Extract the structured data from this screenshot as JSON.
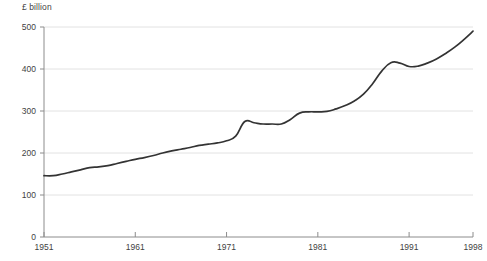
{
  "chart_data": {
    "type": "line",
    "title": "",
    "subtitle": "",
    "unit_label": "£ billion",
    "xlabel": "",
    "ylabel": "",
    "xlim": [
      1951,
      1998
    ],
    "ylim": [
      0,
      500
    ],
    "grid": true,
    "legend_position": "none",
    "line_color": "#333333",
    "gridline_color": "#e2e2e2",
    "axis_color": "#8c8c8c",
    "x_tick_labels": [
      "1951",
      "1961",
      "1971",
      "1981",
      "1991",
      "1998"
    ],
    "x_tick_values": [
      1951,
      1961,
      1971,
      1981,
      1991,
      1998
    ],
    "y_tick_labels": [
      "0",
      "100",
      "200",
      "300",
      "400",
      "500"
    ],
    "y_tick_values": [
      0,
      100,
      200,
      300,
      400,
      500
    ],
    "x": [
      1951,
      1952,
      1953,
      1954,
      1955,
      1956,
      1957,
      1958,
      1959,
      1960,
      1961,
      1962,
      1963,
      1964,
      1965,
      1966,
      1967,
      1968,
      1969,
      1970,
      1971,
      1972,
      1973,
      1974,
      1975,
      1976,
      1977,
      1978,
      1979,
      1980,
      1981,
      1982,
      1983,
      1984,
      1985,
      1986,
      1987,
      1988,
      1989,
      1990,
      1991,
      1992,
      1993,
      1994,
      1995,
      1996,
      1997,
      1998
    ],
    "values": [
      146,
      146,
      150,
      155,
      160,
      165,
      167,
      170,
      175,
      180,
      185,
      189,
      194,
      200,
      205,
      209,
      213,
      218,
      221,
      224,
      229,
      240,
      275,
      272,
      269,
      269,
      269,
      280,
      295,
      298,
      298,
      299,
      305,
      313,
      324,
      340,
      365,
      395,
      415,
      414,
      406,
      407,
      414,
      424,
      437,
      452,
      470,
      490
    ],
    "series": [
      {
        "name": "£ billion",
        "values": [
          146,
          146,
          150,
          155,
          160,
          165,
          167,
          170,
          175,
          180,
          185,
          189,
          194,
          200,
          205,
          209,
          213,
          218,
          221,
          224,
          229,
          240,
          275,
          272,
          269,
          269,
          269,
          280,
          295,
          298,
          298,
          299,
          305,
          313,
          324,
          340,
          365,
          395,
          415,
          414,
          406,
          407,
          414,
          424,
          437,
          452,
          470,
          490
        ]
      }
    ],
    "annotations": []
  },
  "source_note": ""
}
